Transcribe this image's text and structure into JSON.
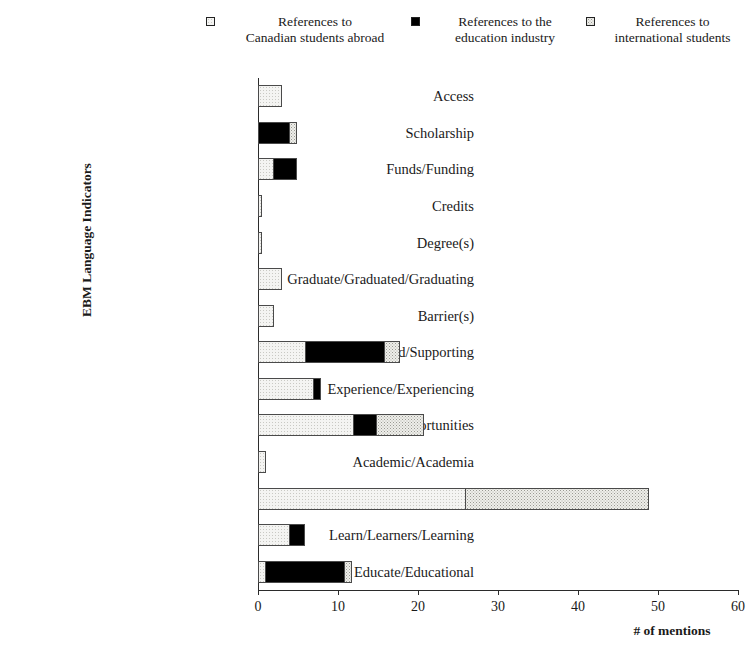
{
  "chart_data": {
    "type": "bar",
    "orientation": "horizontal",
    "stacked": true,
    "title": "",
    "xlabel": "# of mentions",
    "ylabel": "EBM Language Indicators",
    "xlim": [
      0,
      60
    ],
    "xticks": [
      0,
      10,
      20,
      30,
      40,
      50,
      60
    ],
    "grid": false,
    "legend_position": "top",
    "categories": [
      "Access",
      "Scholarship",
      "Funds/Funding",
      "Credits",
      "Degree(s)",
      "Graduate/Graduated/Graduating",
      "Barrier(s)",
      "Support/Supported/Supporting",
      "Experience/Experiencing",
      "Oppportunity/Opportunities",
      "Academic/Academia",
      "Study/Studying",
      "Learn/Learners/Learning",
      "Educate/Educational"
    ],
    "series": [
      {
        "name": "References to Canadian students abroad",
        "fill": "canadian",
        "values": [
          3,
          0,
          2,
          0.5,
          0.5,
          3,
          2,
          6,
          7,
          12,
          1,
          26,
          4,
          1
        ]
      },
      {
        "name": "References to the education industry",
        "fill": "industry",
        "values": [
          0,
          4,
          3,
          0,
          0,
          0,
          0,
          10,
          1,
          3,
          0,
          0,
          2,
          10
        ]
      },
      {
        "name": "References to international students",
        "fill": "international",
        "values": [
          0,
          1,
          0,
          0,
          0,
          0,
          0,
          2,
          0,
          6,
          0,
          23,
          0,
          1
        ]
      }
    ],
    "totals": [
      3,
      5,
      5,
      0.5,
      0.5,
      3,
      2,
      18,
      8,
      21,
      1,
      49,
      6,
      12
    ]
  },
  "legend": {
    "entries": [
      {
        "label_line1": "References to",
        "label_line2": "Canadian students abroad",
        "marker": "empty-square-swatch"
      },
      {
        "label_line1": "References to the",
        "label_line2": "education industry",
        "marker": "filled-square-swatch"
      },
      {
        "label_line1": "References to",
        "label_line2": "international students",
        "marker": "stippled-square-swatch"
      }
    ]
  },
  "axes": {
    "x_title": "# of mentions",
    "y_title": "EBM Language Indicators",
    "x_tick_labels": [
      "0",
      "10",
      "20",
      "30",
      "40",
      "50",
      "60"
    ]
  }
}
